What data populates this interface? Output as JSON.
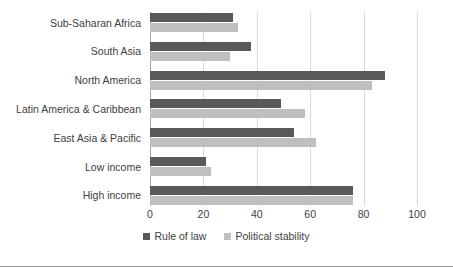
{
  "chart_data": {
    "type": "bar",
    "orientation": "horizontal",
    "title": "",
    "subtitle": "",
    "xlabel": "",
    "ylabel": "",
    "xlim": [
      0,
      100
    ],
    "xticks": [
      0,
      20,
      40,
      60,
      80,
      100
    ],
    "xtick_labels": [
      "0",
      "20",
      "40",
      "60",
      "80",
      "100"
    ],
    "grid": true,
    "legend_position": "bottom",
    "categories": [
      "Sub-Saharan Africa",
      "South Asia",
      "North America",
      "Latin America & Caribbean",
      "East Asia & Pacific",
      "Low income",
      "High income"
    ],
    "series": [
      {
        "name": "Rule of law",
        "color": "#595959",
        "values": [
          31,
          38,
          88,
          49,
          54,
          21,
          76
        ]
      },
      {
        "name": "Political stability",
        "color": "#bfbfbf",
        "values": [
          33,
          30,
          83,
          58,
          62,
          23,
          76
        ]
      }
    ]
  },
  "colors": {
    "rule_of_law": "#595959",
    "political_stability": "#bfbfbf",
    "gridline": "#d9d9d9",
    "axis": "#a6a6a6",
    "text": "#404040",
    "background": "#ffffff"
  }
}
